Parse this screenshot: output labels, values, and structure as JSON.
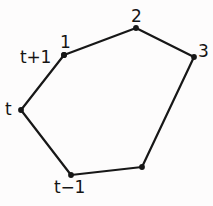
{
  "figure": {
    "name": "closed-polygon-trajectory",
    "width": 213,
    "height": 206,
    "background_color": "#fdfcfc",
    "stroke_color": "#171717",
    "text_color": "#151515",
    "vertex_marker_color": "#171717"
  },
  "chart_data": {
    "type": "scatter",
    "title": "",
    "xlabel": "",
    "ylabel": "",
    "xlim": [
      0,
      213
    ],
    "ylim": [
      0,
      206
    ],
    "grid": false,
    "legend": false,
    "closed_path": true,
    "series": [
      {
        "name": "polygon-vertices",
        "marker": "filled-circle",
        "points": [
          {
            "id": "v-1",
            "label": "1",
            "x": 64,
            "y": 55,
            "label_x": 60,
            "label_y": 34,
            "has_label": true
          },
          {
            "id": "v-2",
            "label": "2",
            "x": 136,
            "y": 28,
            "label_x": 131,
            "label_y": 8,
            "has_label": true
          },
          {
            "id": "v-3",
            "label": "3",
            "x": 194,
            "y": 57,
            "label_x": 198,
            "label_y": 43,
            "has_label": true
          },
          {
            "id": "v-4",
            "label": "",
            "x": 142,
            "y": 167,
            "label_x": 0,
            "label_y": 0,
            "has_label": false
          },
          {
            "id": "v-tm1",
            "label": "t−1",
            "x": 71,
            "y": 175,
            "label_x": 54,
            "label_y": 179,
            "has_label": true
          },
          {
            "id": "v-t",
            "label": "t",
            "x": 21,
            "y": 110,
            "label_x": 5,
            "label_y": 101,
            "has_label": true
          },
          {
            "id": "v-tp1",
            "label": "t+1",
            "x": 64,
            "y": 55,
            "label_x": 20,
            "label_y": 49,
            "has_label": true,
            "secondary_label": true
          }
        ]
      }
    ],
    "edges": [
      {
        "name": "edge-1-2",
        "from": "v-1",
        "to": "v-2"
      },
      {
        "name": "edge-2-3",
        "from": "v-2",
        "to": "v-3"
      },
      {
        "name": "edge-3-4",
        "from": "v-3",
        "to": "v-4"
      },
      {
        "name": "edge-4-tm1",
        "from": "v-4",
        "to": "v-tm1"
      },
      {
        "name": "edge-tm1-t",
        "from": "v-tm1",
        "to": "v-t"
      },
      {
        "name": "edge-t-1",
        "from": "v-t",
        "to": "v-1"
      }
    ],
    "labels": [
      {
        "name": "label-1",
        "text": "1",
        "x": 60,
        "y": 34
      },
      {
        "name": "label-2",
        "text": "2",
        "x": 131,
        "y": 8
      },
      {
        "name": "label-3",
        "text": "3",
        "x": 198,
        "y": 43
      },
      {
        "name": "label-t",
        "text": "t",
        "x": 5,
        "y": 101
      },
      {
        "name": "label-tp1",
        "text": "t+1",
        "x": 20,
        "y": 49
      },
      {
        "name": "label-tm1",
        "text": "t−1",
        "x": 54,
        "y": 179
      }
    ]
  }
}
